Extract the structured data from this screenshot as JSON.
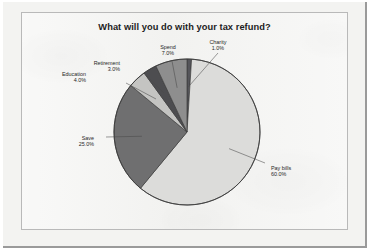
{
  "frame": {
    "border_color": "#2e2e2e",
    "panel_bg": "#f1f1ef"
  },
  "chart_data": {
    "type": "pie",
    "title": "What will you do with your tax refund?",
    "xlabel": "",
    "ylabel": "",
    "start_angle_deg": 0,
    "direction": "clockwise",
    "legend": "none",
    "grid": false,
    "categories": [
      "Charity",
      "Pay bills",
      "Save",
      "Education",
      "Retirement",
      "Spend"
    ],
    "values": [
      1.0,
      60.0,
      25.0,
      4.0,
      3.0,
      7.0
    ],
    "value_unit": "%",
    "slices": [
      {
        "label": "Charity",
        "value": 1.0,
        "pct_text": "1.0%",
        "color": "#55555a"
      },
      {
        "label": "Pay bills",
        "value": 60.0,
        "pct_text": "60.0%",
        "color": "#dcdcda"
      },
      {
        "label": "Save",
        "value": 25.0,
        "pct_text": "25.0%",
        "color": "#6f6f70"
      },
      {
        "label": "Education",
        "value": 4.0,
        "pct_text": "4.0%",
        "color": "#c4c4c2"
      },
      {
        "label": "Retirement",
        "value": 3.0,
        "pct_text": "3.0%",
        "color": "#4d4d50"
      },
      {
        "label": "Spend",
        "value": 7.0,
        "pct_text": "7.0%",
        "color": "#8e8e8e"
      }
    ]
  }
}
